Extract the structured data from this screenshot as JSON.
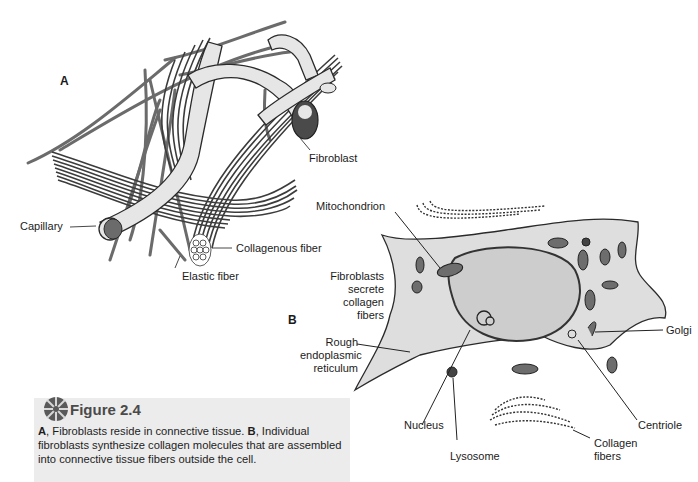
{
  "figure": {
    "number_label": "Figure 2.4",
    "icon": "rosette-icon",
    "caption_part_a_label": "A",
    "caption_part_a": ", Fibroblasts reside in connective tissue. ",
    "caption_part_b_label": "B",
    "caption_part_b": ", Individual fibroblasts synthesize collagen molecules that are assembled into connective tissue fibers outside the cell."
  },
  "panel_a": {
    "label": "A",
    "labels": {
      "fibroblast": "Fibroblast",
      "capillary": "Capillary",
      "collagenous_fiber": "Collagenous fiber",
      "elastic_fiber": "Elastic fiber"
    }
  },
  "panel_b": {
    "label": "B",
    "labels": {
      "mitochondrion": "Mitochondrion",
      "fibroblasts_secrete_1": "Fibroblasts",
      "fibroblasts_secrete_2": "secrete",
      "fibroblasts_secrete_3": "collagen",
      "fibroblasts_secrete_4": "fibers",
      "rough_er_1": "Rough",
      "rough_er_2": "endoplasmic",
      "rough_er_3": "reticulum",
      "golgi": "Golgi",
      "centriole": "Centriole",
      "nucleus": "Nucleus",
      "lysosome": "Lysosome",
      "collagen_fibers_1": "Collagen",
      "collagen_fibers_2": "fibers"
    }
  },
  "colors": {
    "fiber_dark": "#3c3c3c",
    "fiber_mid": "#6e6e6e",
    "capillary_fill": "#e4e4e4",
    "cytoplasm_fill": "#dcdcdc",
    "nucleus_fill": "#cfcfcf",
    "caption_bg": "#ececec"
  }
}
